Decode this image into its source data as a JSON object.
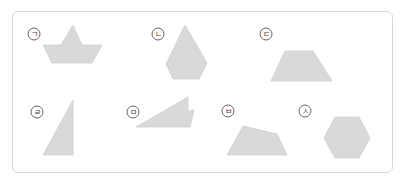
{
  "figure": {
    "shapes": [
      {
        "label": "ㄱ",
        "name": "boat",
        "label_pos": [
          34,
          34
        ],
        "points": "61,45 73,25 82,45 102,45 92,63 52,63 43,45"
      },
      {
        "label": "ㄴ",
        "name": "kite-pentagon",
        "label_pos": [
          158,
          34
        ],
        "points": "185,25 207,63 199,79 173,79 166,64"
      },
      {
        "label": "ㄷ",
        "name": "trapezoid",
        "label_pos": [
          266,
          34
        ],
        "points": "285,51 313,51 332,81 271,81"
      },
      {
        "label": "ㄹ",
        "name": "right-triangle",
        "label_pos": [
          37,
          112
        ],
        "points": "73,100 73,155 43,155"
      },
      {
        "label": "ㅁ",
        "name": "notched-triangle",
        "label_pos": [
          133,
          112
        ],
        "points": "136,127 188,97 188,111 194,110 190,127"
      },
      {
        "label": "ㅂ",
        "name": "quadrilateral",
        "label_pos": [
          228,
          111
        ],
        "points": "243,126 277,134 287,155 227,155"
      },
      {
        "label": "ㅅ",
        "name": "hexagon",
        "label_pos": [
          305,
          111
        ],
        "points": "335,117 359,117 370,138 359,158 335,158 324,138"
      }
    ],
    "colors": {
      "shape_fill": "#d9d9d9",
      "shape_stroke": "#cfcfcf",
      "border": "#d8d8d8"
    }
  }
}
